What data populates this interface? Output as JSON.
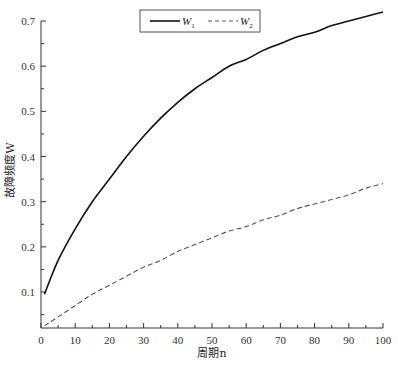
{
  "chart_data": {
    "type": "line",
    "title": "",
    "xlabel": "周期n",
    "ylabel": "故障频度W",
    "xlim": [
      0,
      100
    ],
    "ylim": [
      0.02,
      0.7
    ],
    "x_ticks": [
      0,
      10,
      20,
      30,
      40,
      50,
      60,
      70,
      80,
      90,
      100
    ],
    "y_ticks": [
      0.1,
      0.2,
      0.3,
      0.4,
      0.5,
      0.6,
      0.7
    ],
    "grid": false,
    "legend_position": "top-center",
    "x": [
      1,
      5,
      10,
      15,
      20,
      25,
      30,
      35,
      40,
      45,
      50,
      55,
      60,
      65,
      70,
      75,
      80,
      85,
      90,
      95,
      100
    ],
    "series": [
      {
        "name": "W1",
        "label_main": "W",
        "label_sub": "1",
        "style": "solid",
        "color": "#111111",
        "values": [
          0.095,
          0.17,
          0.24,
          0.3,
          0.35,
          0.4,
          0.445,
          0.485,
          0.52,
          0.55,
          0.575,
          0.6,
          0.615,
          0.635,
          0.65,
          0.665,
          0.675,
          0.69,
          0.7,
          0.71,
          0.72
        ]
      },
      {
        "name": "W2",
        "label_main": "W",
        "label_sub": "2",
        "style": "dashed",
        "color": "#555555",
        "values": [
          0.025,
          0.045,
          0.07,
          0.095,
          0.115,
          0.135,
          0.155,
          0.17,
          0.19,
          0.205,
          0.22,
          0.235,
          0.245,
          0.26,
          0.27,
          0.285,
          0.295,
          0.305,
          0.315,
          0.33,
          0.34
        ]
      }
    ]
  }
}
